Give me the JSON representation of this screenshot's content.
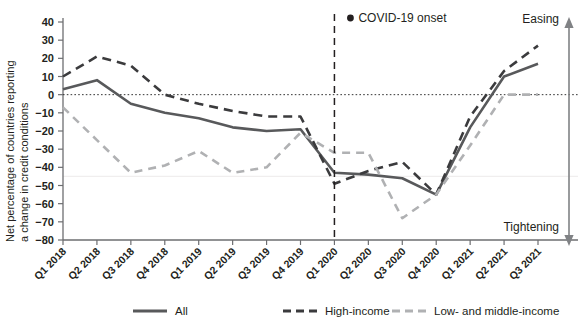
{
  "chart_data": {
    "type": "line",
    "title": "",
    "xlabel": "",
    "ylabel": "Net percentage of countries reporting a change in credit conditions",
    "ylabel_line1": "Net percentage of countries reporting",
    "ylabel_line2": "a change in credit conditions",
    "ylim": [
      -80,
      40
    ],
    "yticks": [
      40,
      30,
      20,
      10,
      0,
      -10,
      -20,
      -30,
      -40,
      -50,
      -60,
      -70,
      -80
    ],
    "ytick_labels": [
      "40",
      "30",
      "20",
      "10",
      "0",
      "−10",
      "−20",
      "−30",
      "−40",
      "−50",
      "−60",
      "−70",
      "−80"
    ],
    "grid": false,
    "zero_line": true,
    "legend_position": "bottom",
    "categories": [
      "Q1 2018",
      "Q2 2018",
      "Q3 2018",
      "Q4 2018",
      "Q1 2019",
      "Q2 2019",
      "Q3 2019",
      "Q4 2019",
      "Q1 2020",
      "Q2 2020",
      "Q3 2020",
      "Q4 2020",
      "Q1 2021",
      "Q2 2021",
      "Q3 2021"
    ],
    "series": [
      {
        "name": "All",
        "style": "solid",
        "color": "#58595b",
        "values": [
          3,
          8,
          -5,
          -10,
          -13,
          -18,
          -20,
          -19,
          -43,
          -44,
          -46,
          -55,
          -18,
          10,
          17
        ]
      },
      {
        "name": "High-income",
        "style": "dashed",
        "color": "#3b3b3d",
        "values": [
          10,
          21,
          16,
          0,
          -5,
          -9,
          -12,
          -12,
          -49,
          -42,
          -37,
          -55,
          -12,
          13,
          27
        ]
      },
      {
        "name": "Low- and middle-income",
        "style": "dashed",
        "color": "#b0b1b3",
        "values": [
          -7,
          -25,
          -43,
          -39,
          -31,
          -43,
          -40,
          -21,
          -32,
          -32,
          -68,
          -55,
          -28,
          0,
          0
        ]
      }
    ],
    "annotations": [
      {
        "name": "covid-onset",
        "label": "COVID-19 onset",
        "at_category": "Q1 2020",
        "marker": "dot",
        "line_style": "dashed"
      }
    ],
    "direction_axis": {
      "top_label": "Easing",
      "bottom_label": "Tightening",
      "arrow": "double"
    }
  },
  "legend": {
    "items": [
      {
        "label": "All",
        "style": "solid",
        "color": "#58595b"
      },
      {
        "label": "High-income",
        "style": "dashed",
        "color": "#3b3b3d"
      },
      {
        "label": "Low- and middle-income",
        "style": "dashed",
        "color": "#b0b1b3"
      }
    ]
  },
  "colors": {
    "all": "#58595b",
    "high_income": "#3b3b3d",
    "low_middle_income": "#b0b1b3",
    "axis": "#6d6e71",
    "text": "#231f20"
  }
}
